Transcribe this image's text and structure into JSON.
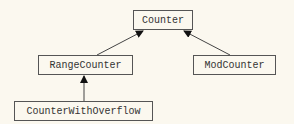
{
  "diagram": {
    "nodes": [
      {
        "id": "counter",
        "label": "Counter"
      },
      {
        "id": "range",
        "label": "RangeCounter"
      },
      {
        "id": "mod",
        "label": "ModCounter"
      },
      {
        "id": "overflow",
        "label": "CounterWithOverflow"
      }
    ],
    "edges": [
      {
        "from": "RangeCounter",
        "to": "Counter",
        "type": "inheritance-arrow"
      },
      {
        "from": "ModCounter",
        "to": "Counter",
        "type": "inheritance-arrow"
      },
      {
        "from": "CounterWithOverflow",
        "to": "RangeCounter",
        "type": "inheritance-arrow"
      }
    ],
    "colors": {
      "background": "#fbf8ef",
      "stroke": "#555555",
      "text": "#333333"
    }
  }
}
